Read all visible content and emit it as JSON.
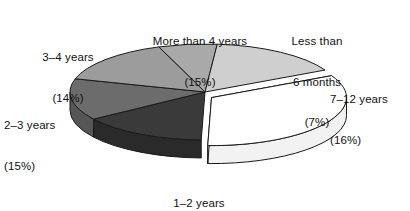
{
  "chart_data": {
    "type": "pie",
    "title": "",
    "subtitle": "",
    "xlabel": "",
    "ylabel": "",
    "legend_position": "none",
    "grid": false,
    "style": "3d-exploded-pie",
    "categories": [
      "Less than 6 months",
      "7–12 years",
      "1–2 years",
      "2–3 years",
      "3–4 years",
      "More than 4 years"
    ],
    "values": [
      7,
      16,
      33,
      15,
      14,
      15
    ],
    "units": "percent",
    "total": 100,
    "slices": [
      {
        "key": "less-than-6-months",
        "label": "Less than 6 months",
        "label_lines": [
          "Less than",
          "6 months"
        ],
        "percent_text": "(7%)",
        "value": 7,
        "color": "#a9a9a9",
        "side_color": "#8d8d8d",
        "exploded": false
      },
      {
        "key": "7-12-years",
        "label": "7–12 years",
        "label_lines": [
          "7–12 years"
        ],
        "percent_text": "(16%)",
        "value": 16,
        "color": "#cfcfcf",
        "side_color": "#b2b2b2",
        "exploded": false
      },
      {
        "key": "1-2-years",
        "label": "1–2 years",
        "label_lines": [
          "1–2 years"
        ],
        "percent_text": "(33%)",
        "value": 33,
        "color": "#ffffff",
        "side_color": "#f2f2f2",
        "exploded": true
      },
      {
        "key": "2-3-years",
        "label": "2–3 years",
        "label_lines": [
          "2–3 years"
        ],
        "percent_text": "(15%)",
        "value": 15,
        "color": "#3a3a3a",
        "side_color": "#2a2a2a",
        "exploded": false
      },
      {
        "key": "3-4-years",
        "label": "3–4 years",
        "label_lines": [
          "3–4 years"
        ],
        "percent_text": "(14%)",
        "value": 14,
        "color": "#6c6c6c",
        "side_color": "#565656",
        "exploded": false
      },
      {
        "key": "more-than-4-years",
        "label": "More than 4 years",
        "label_lines": [
          "More than 4 years"
        ],
        "percent_text": "(15%)",
        "value": 15,
        "color": "#9c9c9c",
        "side_color": "#838383",
        "exploded": false
      }
    ],
    "colors": {
      "background": "#ffffff",
      "outline": "#1a1a1a",
      "text": "#111111"
    }
  },
  "labels": {
    "more_than_4": {
      "line1": "More than 4 years",
      "line2": "(15%)"
    },
    "less_than_6": {
      "line1": "Less than",
      "line2": "6 months",
      "line3": "(7%)"
    },
    "years_7_12": {
      "line1": "7–12 years",
      "line2": "(16%)"
    },
    "years_1_2": {
      "line1": "1–2 years",
      "line2": "(33%)"
    },
    "years_2_3": {
      "line1": "2–3 years",
      "line2": "(15%)"
    },
    "years_3_4": {
      "line1": "3–4 years",
      "line2": "(14%)"
    }
  }
}
